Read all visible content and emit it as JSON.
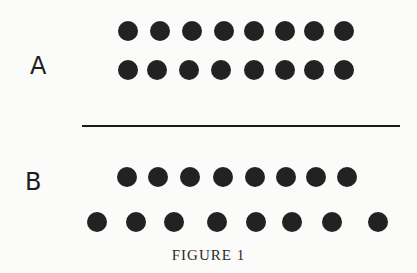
{
  "figure": {
    "caption": "FIGURE 1",
    "panels": [
      {
        "label": "A",
        "label_pos": {
          "x": 30,
          "y": 54
        },
        "rows": [
          {
            "name": "row-1",
            "dot_count": 8,
            "y": 31,
            "x": [
              128,
              160,
              192,
              224,
              254,
              285,
              314,
              344
            ]
          },
          {
            "name": "row-2",
            "dot_count": 8,
            "y": 70,
            "x": [
              128,
              157,
              189,
              221,
              254,
              285,
              314,
              344
            ]
          }
        ]
      },
      {
        "label": "B",
        "label_pos": {
          "x": 25,
          "y": 170
        },
        "rows": [
          {
            "name": "row-1",
            "dot_count": 8,
            "y": 177,
            "x": [
              127,
              158,
              190,
              223,
              255,
              286,
              316,
              347
            ]
          },
          {
            "name": "row-2",
            "dot_count": 8,
            "y": 222,
            "x": [
              97,
              136,
              174,
              217,
              256,
              292,
              332,
              378
            ]
          }
        ]
      }
    ],
    "divider": {
      "x1": 82,
      "x2": 400,
      "y": 126
    },
    "dot_color": "#222222",
    "dot_diameter": 20
  }
}
